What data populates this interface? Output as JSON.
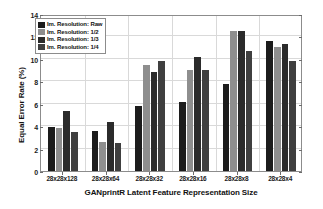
{
  "chart_data": {
    "type": "bar",
    "title": "",
    "xlabel": "GANprintR Latent Feature Representation Size",
    "ylabel": "Equal Error Rate (%)",
    "categories": [
      "28x28x128",
      "28x28x64",
      "28x28x32",
      "28x28x16",
      "28x28x8",
      "28x28x4"
    ],
    "series": [
      {
        "name": "Im. Resolution: Raw",
        "color": "#1c1c1c",
        "values": [
          3.9,
          3.55,
          5.8,
          6.15,
          7.8,
          11.6
        ]
      },
      {
        "name": "Im. Resolution: 1/2",
        "color": "#8e8e8e",
        "values": [
          3.85,
          2.6,
          9.45,
          9.05,
          12.5,
          11.1
        ]
      },
      {
        "name": "Im. Resolution: 1/3",
        "color": "#2b2b2b",
        "values": [
          5.35,
          4.4,
          8.85,
          10.15,
          12.5,
          11.3
        ]
      },
      {
        "name": "Im. Resolution: 1/4",
        "color": "#3f3f3f",
        "values": [
          3.5,
          2.5,
          9.8,
          9.0,
          10.7,
          9.85
        ]
      }
    ],
    "ylim": [
      0,
      14
    ],
    "yticks": [
      0,
      2,
      4,
      6,
      8,
      10,
      12,
      14
    ],
    "ytick_labels": [
      "0",
      "2",
      "4",
      "6",
      "8",
      "10",
      "12",
      "14"
    ],
    "grid": true,
    "legend_position": "upper left"
  },
  "legend": {
    "entries": [
      {
        "label": "Im. Resolution: Raw"
      },
      {
        "label": "Im. Resolution: 1/2"
      },
      {
        "label": "Im. Resolution: 1/3"
      },
      {
        "label": "Im. Resolution: 1/4"
      }
    ]
  }
}
